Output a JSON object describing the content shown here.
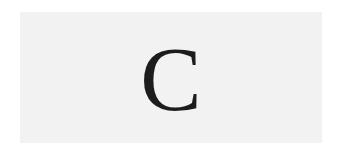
{
  "card": {
    "letter": "C",
    "background_color": "#f2f2f2",
    "text_color": "#1c1c1c"
  }
}
